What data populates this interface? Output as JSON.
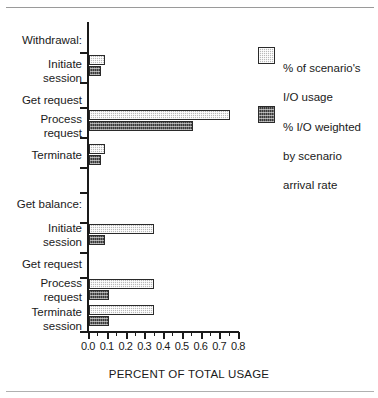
{
  "chart_data": {
    "type": "bar",
    "orientation": "horizontal",
    "title": "",
    "xlabel": "PERCENT OF TOTAL USAGE",
    "ylabel": "",
    "xlim": [
      0.0,
      0.8
    ],
    "xticks": [
      "0.0",
      "0.1",
      "0.2",
      "0.3",
      "0.4",
      "0.5",
      "0.6",
      "0.7",
      "0.8"
    ],
    "xtick_values": [
      0.0,
      0.1,
      0.2,
      0.3,
      0.4,
      0.5,
      0.6,
      0.7,
      0.8
    ],
    "minor_ticks_per_interval": 1,
    "grid": false,
    "legend_position": "right",
    "groups": [
      {
        "name": "Withdrawal:",
        "categories": [
          {
            "label": "Initiate\nsession",
            "scenario_io": 0.085,
            "weighted_io": 0.065
          },
          {
            "label": "Process\nrequest",
            "scenario_io": 0.75,
            "weighted_io": 0.555
          },
          {
            "label": "Terminate",
            "scenario_io": 0.085,
            "weighted_io": 0.065
          }
        ],
        "subheading": "Get request"
      },
      {
        "name": "Get balance:",
        "categories": [
          {
            "label": "Initiate\nsession",
            "scenario_io": 0.345,
            "weighted_io": 0.085
          },
          {
            "label": "Process\nrequest",
            "scenario_io": 0.345,
            "weighted_io": 0.105
          },
          {
            "label": "Terminate\nsession",
            "scenario_io": 0.345,
            "weighted_io": 0.105
          }
        ],
        "subheading": "Get request"
      }
    ],
    "categories": [
      "Withdrawal: Initiate session",
      "Withdrawal: Process request",
      "Withdrawal: Terminate",
      "Get balance: Initiate session",
      "Get balance: Process request",
      "Get balance: Terminate session"
    ],
    "series": [
      {
        "name": "% of scenario's I/O usage",
        "pattern": "light-stipple",
        "color": "#b9b9b9",
        "values": [
          0.085,
          0.75,
          0.085,
          0.345,
          0.345,
          0.345
        ]
      },
      {
        "name": "% I/O weighted by scenario arrival rate",
        "pattern": "dark-crosshatch",
        "color": "#3a3a3a",
        "values": [
          0.065,
          0.555,
          0.065,
          0.085,
          0.105,
          0.105
        ]
      }
    ]
  },
  "axis": {
    "title": "PERCENT OF TOTAL USAGE",
    "ticks": [
      {
        "label": "0.0",
        "value": 0.0
      },
      {
        "label": "0.1",
        "value": 0.1
      },
      {
        "label": "0.2",
        "value": 0.2
      },
      {
        "label": "0.3",
        "value": 0.3
      },
      {
        "label": "0.4",
        "value": 0.4
      },
      {
        "label": "0.5",
        "value": 0.5
      },
      {
        "label": "0.6",
        "value": 0.6
      },
      {
        "label": "0.7",
        "value": 0.7
      },
      {
        "label": "0.8",
        "value": 0.8
      }
    ]
  },
  "labels": {
    "group1_header": "Withdrawal:",
    "g1_c1_line1": "Initiate",
    "g1_c1_line2": "session",
    "g1_sub": "Get request",
    "g1_c2_line1": "Process",
    "g1_c2_line2": "request",
    "g1_c3_line1": "Terminate",
    "group2_header": "Get balance:",
    "g2_c1_line1": "Initiate",
    "g2_c1_line2": "session",
    "g2_sub": "Get request",
    "g2_c2_line1": "Process",
    "g2_c2_line2": "request",
    "g2_c3_line1": "Terminate",
    "g2_c3_line2": "session"
  },
  "legend": {
    "items": [
      {
        "line1": "% of scenario's",
        "line2": "I/O usage",
        "pattern": "light-stipple"
      },
      {
        "line1": "% I/O weighted",
        "line2": "by scenario",
        "line3": "arrival  rate",
        "pattern": "dark-crosshatch"
      }
    ]
  }
}
